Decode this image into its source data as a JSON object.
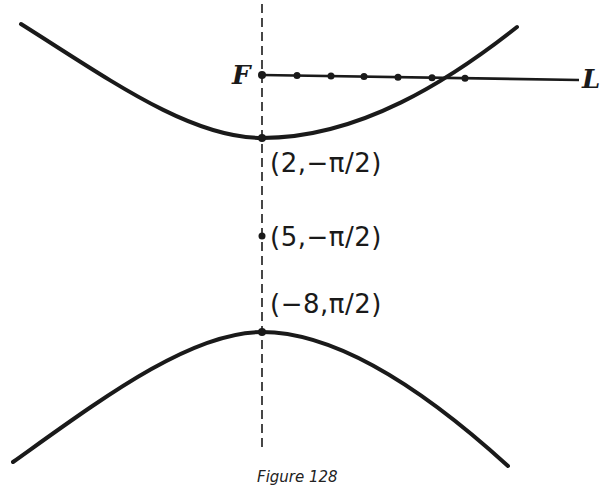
{
  "figure": {
    "caption": "Figure 128",
    "focus_label": "F",
    "axis_label": "L",
    "points": [
      {
        "id": "upper-vertex",
        "label_r": "2",
        "label_theta": "−π/2",
        "text": "(2,−π/2)"
      },
      {
        "id": "center",
        "label_r": "5",
        "label_theta": "−π/2",
        "text": "(5,−π/2)"
      },
      {
        "id": "lower-vertex",
        "label_r": "−8",
        "label_theta": "π/2",
        "text": "(−8,π/2)"
      }
    ],
    "colors": {
      "ink": "#1a1a1a",
      "background": "#ffffff"
    }
  }
}
